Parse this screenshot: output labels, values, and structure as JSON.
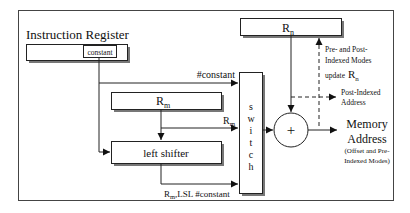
{
  "diagram": {
    "title": "Instruction Register",
    "instruction_register": {
      "field_label": "constant"
    },
    "registers": {
      "rn": {
        "base": "R",
        "sub": "n"
      },
      "rm": {
        "base": "R",
        "sub": "m"
      }
    },
    "left_shifter": {
      "label": "left shifter"
    },
    "switch": {
      "letters": [
        "s",
        "w",
        "i",
        "t",
        "c",
        "h"
      ]
    },
    "adder": {
      "symbol": "+"
    },
    "edge_labels": {
      "constant_in": "#constant",
      "rm_in": {
        "base": "R",
        "sub": "m"
      },
      "shifted_in": {
        "base": "R",
        "sub": "m",
        "suffix": ",LSL #constant"
      }
    },
    "annotations": {
      "update_rn": {
        "line1": "Pre- and Post-",
        "line2": "Indexed Modes",
        "line3": "update",
        "reg_base": "R",
        "reg_sub": "n"
      },
      "post_indexed": {
        "line1": "Post-Indexed",
        "line2": "Address"
      },
      "memory_address": {
        "line1": "Memory",
        "line2": "Address",
        "note1": "(Offset and Pre-",
        "note2": "Indexed Modes)"
      }
    },
    "colors": {
      "stroke": "#222222",
      "shadow": "#555555",
      "background": "#ffffff"
    }
  }
}
